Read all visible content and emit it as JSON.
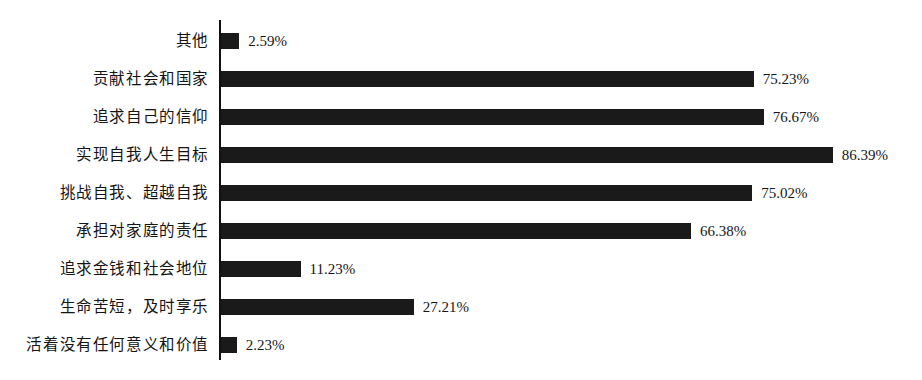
{
  "chart_data": {
    "type": "bar",
    "orientation": "horizontal",
    "title": "",
    "subtitle": "",
    "xlabel": "",
    "ylabel": "",
    "xlim": [
      0,
      100
    ],
    "grid": false,
    "legend": false,
    "value_suffix": "%",
    "bar_color": "#1a1a1a",
    "axis_color": "#111111",
    "background_color": "#ffffff",
    "categories": [
      "其他",
      "贡献社会和国家",
      "追求自己的信仰",
      "实现自我人生目标",
      "挑战自我、超越自我",
      "承担对家庭的责任",
      "追求金钱和社会地位",
      "生命苦短，及时享乐",
      "活着没有任何意义和价值"
    ],
    "values": [
      2.59,
      75.23,
      76.67,
      86.39,
      75.02,
      66.38,
      11.23,
      27.21,
      2.23
    ],
    "value_labels": [
      "2.59%",
      "75.23%",
      "76.67%",
      "86.39%",
      "75.02%",
      "66.38%",
      "11.23%",
      "27.21%",
      "2.23%"
    ]
  }
}
